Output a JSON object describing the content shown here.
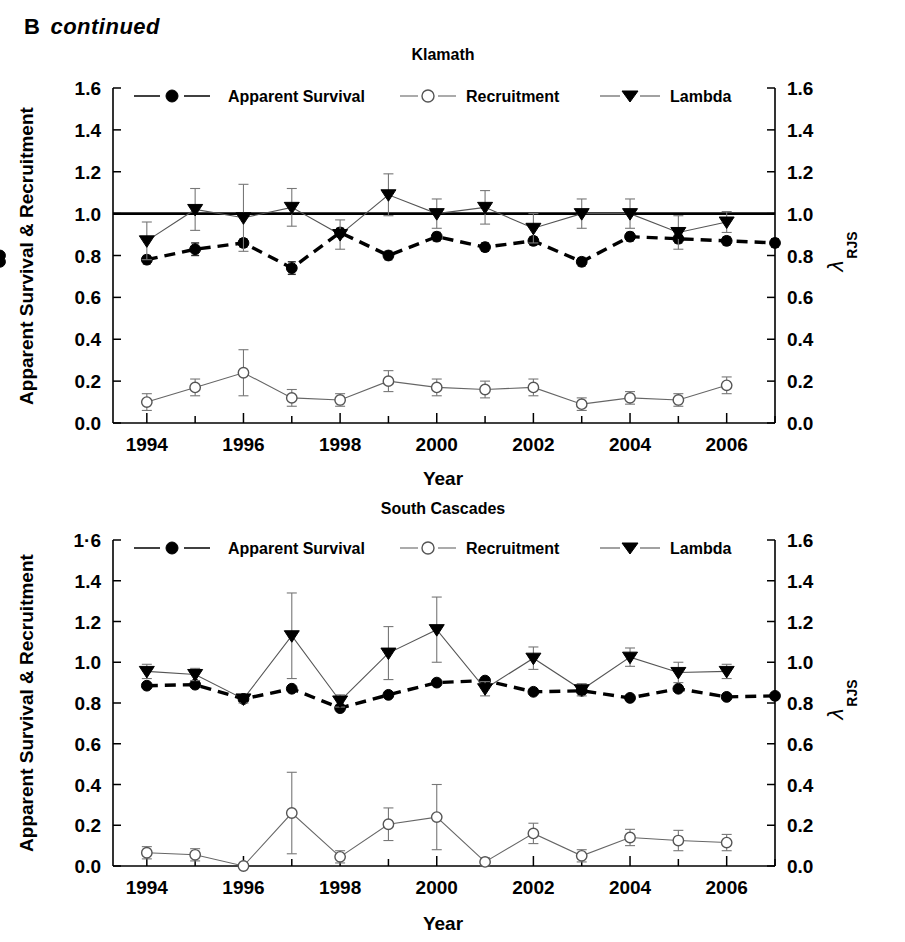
{
  "panel": {
    "letter": "B",
    "continued": "continued"
  },
  "axes": {
    "y_left_title": "Apparent Survival & Recruitment",
    "y_right_title_main": "λ",
    "y_right_title_sub": "RJS",
    "x_title": "Year",
    "y_ticks": [
      "0.0",
      "0.2",
      "0.4",
      "0.6",
      "0.8",
      "1.0",
      "1.2",
      "1.4",
      "1.6"
    ],
    "y_ticks_bottom_left": [
      "0.0",
      "0.2",
      "0.4",
      "0.6",
      "0.8",
      "1.0",
      "1.2",
      "1.4",
      "1·6"
    ],
    "x_ticks": [
      "1994",
      "1996",
      "1998",
      "2000",
      "2002",
      "2004",
      "2006"
    ]
  },
  "legend": {
    "items": [
      {
        "label": "Apparent Survival",
        "marker": "filled-circle-icon",
        "line": "dashed"
      },
      {
        "label": "Recruitment",
        "marker": "open-circle-icon",
        "line": "thin"
      },
      {
        "label": "Lambda",
        "marker": "filled-triangle-down-icon",
        "line": "thin"
      }
    ]
  },
  "chart_data": [
    {
      "type": "line",
      "title": "Klamath",
      "xlabel": "Year",
      "ylabel": "Apparent Survival & Recruitment",
      "y2label": "λ RJS",
      "xlim": [
        1993.3,
        2007.0
      ],
      "ylim": [
        0.0,
        1.6
      ],
      "grid": false,
      "legend_position": "top",
      "reference_line": {
        "y": 1.0,
        "style": "solid-bold"
      },
      "x": [
        1994,
        1995,
        1996,
        1997,
        1998,
        1999,
        2000,
        2001,
        2002,
        2003,
        2004,
        2005,
        2006,
        2007
      ],
      "series": [
        {
          "name": "Apparent Survival",
          "marker": "filled-circle",
          "line": "dashed",
          "x": [
            1994,
            1994.7,
            1995.4,
            1996.2,
            1997,
            1997.8,
            1998.6,
            1999.4,
            2000.2,
            2001,
            2001.8,
            2002.6,
            2003.4,
            2004.2,
            2005,
            2005.8,
            2006.6
          ],
          "values": [
            0.78,
            0.83,
            0.86,
            0.74,
            0.91,
            0.8,
            0.89,
            0.84,
            0.87,
            0.77,
            0.89,
            0.88,
            0.87,
            0.86,
            0.8,
            0.77
          ],
          "errors": [
            0.02,
            0.03,
            0.02,
            0.03,
            0.02,
            0.02,
            0.02,
            0.02,
            0.02,
            0.02,
            0.02,
            0.02,
            0.02,
            0.02,
            0.02,
            0.02
          ]
        },
        {
          "name": "Recruitment",
          "marker": "open-circle",
          "line": "thin",
          "values": [
            0.1,
            0.17,
            0.24,
            0.12,
            0.11,
            0.2,
            0.17,
            0.16,
            0.17,
            0.09,
            0.12,
            0.11,
            0.18
          ],
          "errors": [
            0.04,
            0.04,
            0.11,
            0.04,
            0.03,
            0.05,
            0.04,
            0.04,
            0.04,
            0.03,
            0.03,
            0.03,
            0.04
          ]
        },
        {
          "name": "Lambda",
          "marker": "filled-triangle-down",
          "line": "thin",
          "values": [
            0.87,
            1.02,
            0.98,
            1.03,
            0.9,
            1.09,
            1.0,
            1.03,
            0.93,
            1.0,
            1.0,
            0.91,
            0.96
          ],
          "errors": [
            0.09,
            0.1,
            0.16,
            0.09,
            0.07,
            0.1,
            0.07,
            0.08,
            0.07,
            0.07,
            0.07,
            0.08,
            0.05
          ]
        }
      ]
    },
    {
      "type": "line",
      "title": "South Cascades",
      "xlabel": "Year",
      "ylabel": "Apparent Survival & Recruitment",
      "y2label": "λ RJS",
      "xlim": [
        1993.3,
        2007.0
      ],
      "ylim": [
        0.0,
        1.6
      ],
      "grid": false,
      "legend_position": "top",
      "reference_line": null,
      "x": [
        1994,
        1995,
        1996,
        1997,
        1998,
        1999,
        2000,
        2001,
        2002,
        2003,
        2004,
        2005,
        2006,
        2007
      ],
      "series": [
        {
          "name": "Apparent Survival",
          "marker": "filled-circle",
          "line": "dashed",
          "values": [
            0.885,
            0.89,
            0.82,
            0.87,
            0.775,
            0.84,
            0.9,
            0.91,
            0.855,
            0.86,
            0.825,
            0.87,
            0.83,
            0.835
          ],
          "errors": [
            0.01,
            0.01,
            0.01,
            0.01,
            0.01,
            0.01,
            0.01,
            0.01,
            0.01,
            0.01,
            0.01,
            0.01,
            0.01,
            0.01
          ]
        },
        {
          "name": "Recruitment",
          "marker": "open-circle",
          "line": "thin",
          "values": [
            0.065,
            0.055,
            0.0,
            0.26,
            0.045,
            0.205,
            0.24,
            0.02,
            0.16,
            0.05,
            0.14,
            0.125,
            0.115
          ],
          "errors": [
            0.03,
            0.03,
            0.0,
            0.2,
            0.03,
            0.08,
            0.16,
            0.02,
            0.05,
            0.03,
            0.04,
            0.05,
            0.04
          ]
        },
        {
          "name": "Lambda",
          "marker": "filled-triangle-down",
          "line": "thin",
          "values": [
            0.955,
            0.94,
            0.82,
            1.13,
            0.81,
            1.045,
            1.16,
            0.87,
            1.02,
            0.865,
            1.025,
            0.95,
            0.955
          ],
          "errors": [
            0.035,
            0.03,
            0.02,
            0.21,
            0.03,
            0.13,
            0.16,
            0.035,
            0.055,
            0.03,
            0.045,
            0.05,
            0.035
          ]
        }
      ]
    }
  ]
}
